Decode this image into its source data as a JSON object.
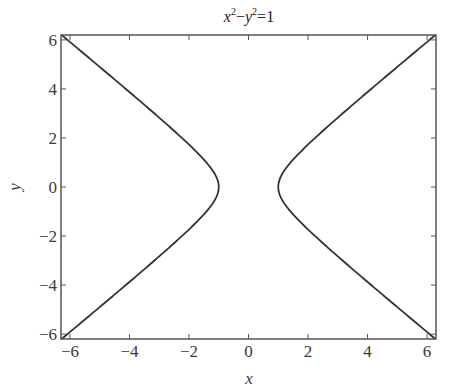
{
  "chart_data": {
    "type": "line",
    "title_parts": {
      "x": "x",
      "x_exp": "2",
      "minus": "−",
      "y": "y",
      "y_exp": "2",
      "rhs": "=1"
    },
    "xlabel": "x",
    "ylabel": "y",
    "xlim": [
      -6.3,
      6.3
    ],
    "ylim": [
      -6.2,
      6.2
    ],
    "xticks": [
      -6,
      -4,
      -2,
      0,
      2,
      4,
      6
    ],
    "yticks": [
      -6,
      -4,
      -2,
      0,
      2,
      4,
      6
    ],
    "xtick_labels": [
      "−6",
      "−4",
      "−2",
      "0",
      "2",
      "4",
      "6"
    ],
    "ytick_labels": [
      "−6",
      "−4",
      "−2",
      "0",
      "2",
      "4",
      "6"
    ],
    "grid": false,
    "legend": null,
    "line_color": "#333333",
    "series": [
      {
        "name": "right branch (x = cosh t, y = sinh t)",
        "x": [
          6.28,
          5.1,
          4.1,
          3.16,
          2.24,
          1.8,
          1.41,
          1.15,
          1.0,
          1.15,
          1.41,
          1.8,
          2.24,
          3.16,
          4.1,
          5.1,
          6.28
        ],
        "y": [
          -6.2,
          -5.0,
          -4.0,
          -3.0,
          -2.0,
          -1.5,
          -1.0,
          -0.57,
          0.0,
          0.57,
          1.0,
          1.5,
          2.0,
          3.0,
          4.0,
          5.0,
          6.2
        ]
      },
      {
        "name": "left branch (x = -cosh t, y = sinh t)",
        "x": [
          -6.28,
          -5.1,
          -4.1,
          -3.16,
          -2.24,
          -1.8,
          -1.41,
          -1.15,
          -1.0,
          -1.15,
          -1.41,
          -1.8,
          -2.24,
          -3.16,
          -4.1,
          -5.1,
          -6.28
        ],
        "y": [
          -6.2,
          -5.0,
          -4.0,
          -3.0,
          -2.0,
          -1.5,
          -1.0,
          -0.57,
          0.0,
          0.57,
          1.0,
          1.5,
          2.0,
          3.0,
          4.0,
          5.0,
          6.2
        ]
      }
    ]
  }
}
